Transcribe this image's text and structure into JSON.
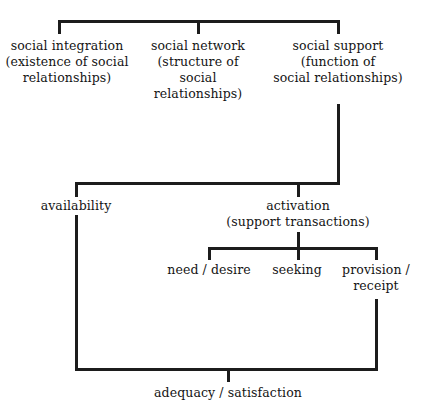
{
  "diagram": {
    "line_color": "#1c1c1c",
    "text_color": "#141414",
    "background": "#ffffff",
    "nodes": {
      "social_integration": "social integration\n(existence of social\nrelationships)",
      "social_network": "social network\n(structure of\nsocial relationships)",
      "social_support": "social support\n(function of\nsocial relationships)",
      "availability": "availability",
      "activation": "activation\n(support transactions)",
      "need_desire": "need / desire",
      "seeking": "seeking",
      "provision_receipt": "provision /\nreceipt",
      "adequacy_satisfaction": "adequacy / satisfaction"
    },
    "levels": [
      {
        "level": 1,
        "items": [
          "social integration (existence of social relationships)",
          "social network (structure of social relationships)",
          "social support (function of social relationships)"
        ]
      },
      {
        "level": 2,
        "items": [
          "availability",
          "activation (support transactions)"
        ]
      },
      {
        "level": 3,
        "items": [
          "need / desire",
          "seeking",
          "provision / receipt"
        ]
      },
      {
        "level": 4,
        "items": [
          "adequacy / satisfaction"
        ]
      }
    ]
  }
}
